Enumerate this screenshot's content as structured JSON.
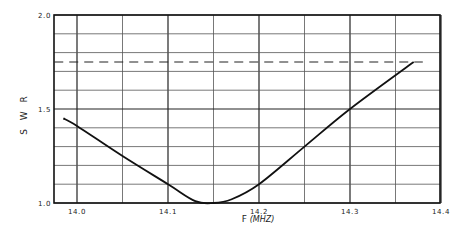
{
  "chart_data": {
    "type": "line",
    "title": "",
    "xlabel": "F (MHZ)",
    "xlabel_main": "F",
    "xlabel_unit": "(MHZ)",
    "ylabel": "S W R",
    "xlim": [
      13.975,
      14.4
    ],
    "ylim": [
      1.0,
      2.0
    ],
    "grid": true,
    "x_ticks": [
      "14.0",
      "14.1",
      "14.2",
      "14.3",
      "14.4"
    ],
    "x_tick_values": [
      14.0,
      14.1,
      14.2,
      14.3,
      14.4
    ],
    "y_ticks": [
      "1.0",
      "1.5",
      "2.0"
    ],
    "y_tick_values": [
      1.0,
      1.5,
      2.0
    ],
    "series": [
      {
        "name": "SWR",
        "style": "solid",
        "x": [
          13.985,
          14.0,
          14.05,
          14.1,
          14.13,
          14.15,
          14.17,
          14.2,
          14.25,
          14.3,
          14.37
        ],
        "values": [
          1.45,
          1.41,
          1.25,
          1.1,
          1.01,
          1.0,
          1.02,
          1.1,
          1.3,
          1.5,
          1.75
        ]
      },
      {
        "name": "SWR reference 1.75",
        "style": "dashed",
        "x": [
          13.975,
          14.38
        ],
        "values": [
          1.75,
          1.75
        ]
      }
    ]
  }
}
